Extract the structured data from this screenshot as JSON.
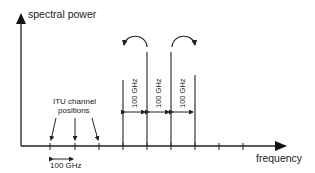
{
  "diagram": {
    "y_axis_label": "spectral power",
    "x_axis_label": "frequency",
    "itu_label_line1": "ITU channel",
    "itu_label_line2": "positions",
    "grid_spacing_label": "100 GHz",
    "spacing_labels": [
      "100 GHz",
      "100 GHz",
      "100 GHz"
    ],
    "tick_positions_x": [
      50,
      75,
      99,
      123,
      147,
      171,
      195,
      219,
      243
    ],
    "channel_lines": [
      {
        "x": 123,
        "top": 80,
        "kind": "short"
      },
      {
        "x": 147,
        "top": 52,
        "kind": "tall"
      },
      {
        "x": 171,
        "top": 52,
        "kind": "tall"
      },
      {
        "x": 195,
        "top": 75,
        "kind": "short"
      }
    ],
    "curved_arrows": [
      {
        "from_x": 147,
        "to_x": 124,
        "direction": "left"
      },
      {
        "from_x": 172,
        "to_x": 196,
        "direction": "right"
      }
    ],
    "colors": {
      "line": "#222222",
      "text": "#222222",
      "background": "#ffffff"
    }
  }
}
